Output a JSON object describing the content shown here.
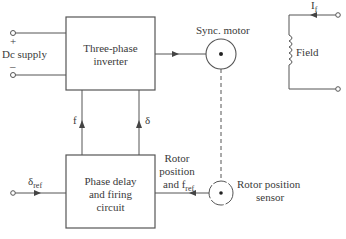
{
  "diagram": {
    "type": "block-diagram",
    "blocks": [
      {
        "id": "inverter",
        "lines": [
          "Three-phase",
          "inverter"
        ]
      },
      {
        "id": "firing",
        "lines": [
          "Phase delay",
          "and firing",
          "circuit"
        ]
      }
    ],
    "labels": {
      "dc_supply": "Dc supply",
      "plus": "+",
      "minus": "–",
      "sync_motor": "Sync. motor",
      "field": "Field",
      "field_current": "I",
      "field_current_sub": "f",
      "f": "f",
      "delta": "δ",
      "delta_ref": "δ",
      "delta_ref_sub": "ref",
      "rotor_pos_line1": "Rotor",
      "rotor_pos_line2": "position",
      "rotor_pos_line3": "and f",
      "rotor_pos_line3_sub": "ref",
      "sensor_line1": "Rotor position",
      "sensor_line2": "sensor"
    },
    "connections": [
      {
        "from": "dc_supply",
        "to": "inverter"
      },
      {
        "from": "inverter",
        "to": "sync_motor"
      },
      {
        "from": "firing",
        "to": "inverter",
        "label": "f"
      },
      {
        "from": "firing",
        "to": "inverter",
        "label": "δ"
      },
      {
        "from": "delta_ref",
        "to": "firing"
      },
      {
        "from": "rotor_position_sensor",
        "to": "firing",
        "label": "Rotor position and f_ref"
      },
      {
        "from": "sync_motor",
        "to": "rotor_position_sensor",
        "style": "dashed"
      }
    ]
  }
}
